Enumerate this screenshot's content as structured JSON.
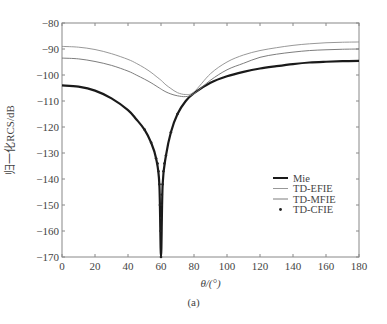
{
  "chart_data": {
    "type": "line",
    "title": "",
    "caption": "(a)",
    "xlabel": "θ/(°)",
    "ylabel": "归一化RCS/dB",
    "xlim": [
      0,
      180
    ],
    "ylim": [
      -170,
      -80
    ],
    "xticks": [
      0,
      20,
      40,
      60,
      80,
      100,
      120,
      140,
      160,
      180
    ],
    "yticks": [
      -80,
      -90,
      -100,
      -110,
      -120,
      -130,
      -140,
      -150,
      -160,
      -170
    ],
    "grid": false,
    "legend_position": "lower right (inside)",
    "x": [
      0,
      10,
      20,
      30,
      40,
      45,
      50,
      54,
      57,
      59,
      60,
      61,
      63,
      66,
      70,
      75,
      80,
      90,
      100,
      110,
      120,
      130,
      140,
      150,
      160,
      170,
      180
    ],
    "series": [
      {
        "name": "Mie",
        "style": "thick solid black",
        "values": [
          -104,
          -104.5,
          -106,
          -109,
          -113.5,
          -117,
          -121,
          -126,
          -132,
          -142,
          -170,
          -142,
          -131,
          -122,
          -115,
          -110,
          -107,
          -103,
          -100.5,
          -98.8,
          -97.5,
          -96.6,
          -95.8,
          -95.2,
          -94.9,
          -94.7,
          -94.6
        ]
      },
      {
        "name": "TD-EFIE",
        "style": "thin solid gray",
        "values": [
          -89,
          -89.3,
          -90.2,
          -91.8,
          -94,
          -95.5,
          -97.3,
          -99,
          -100.5,
          -101.5,
          -102,
          -102.6,
          -103.8,
          -105.2,
          -106.8,
          -107.5,
          -106.5,
          -99.5,
          -95,
          -92.3,
          -90.6,
          -89.5,
          -88.6,
          -88,
          -87.6,
          -87.4,
          -87.3
        ]
      },
      {
        "name": "TD-MFIE",
        "style": "thin solid gray",
        "values": [
          -93.5,
          -93.8,
          -94.8,
          -96.3,
          -98.5,
          -100,
          -101.6,
          -103,
          -104.2,
          -105,
          -105.4,
          -105.8,
          -106.5,
          -107.3,
          -108,
          -108.3,
          -107.2,
          -102,
          -98,
          -95.5,
          -93.2,
          -92,
          -91.2,
          -90.6,
          -90.3,
          -90.1,
          -90
        ]
      },
      {
        "name": "TD-CFIE",
        "style": "dot markers",
        "values": [
          -104,
          -104.5,
          -106,
          -109,
          -113.5,
          -117,
          -121,
          -126,
          -132,
          -142,
          -170,
          -142,
          -131,
          -122,
          -115,
          -110,
          -107,
          -103,
          -100.5,
          -98.8,
          -97.5,
          -96.6,
          -95.8,
          -95.2,
          -94.9,
          -94.7,
          -94.6
        ]
      }
    ]
  },
  "colors": {
    "mie": "#1a1a1a",
    "efie": "#8c8c8c",
    "mfie": "#6e6e6e",
    "cfie": "#222222",
    "axis": "#888888"
  }
}
